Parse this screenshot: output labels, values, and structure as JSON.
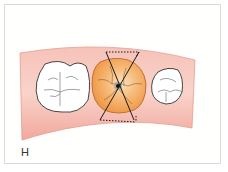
{
  "figure": {
    "panel_label": "H",
    "colors": {
      "gum": "#f4b7ad",
      "gum_edge": "#d9908a",
      "tooth_white": "#ffffff",
      "tooth_outline": "#3a3a3a",
      "target_tooth": "#f2a55a",
      "target_tooth_light": "#fbd6a8",
      "x_lines": "#1a1a1a",
      "frame_border": "#dcdcd6"
    },
    "elements": [
      {
        "name": "left-molar",
        "fill": "white"
      },
      {
        "name": "center-tooth",
        "fill": "orange",
        "marked": "X with dotted hourglass"
      },
      {
        "name": "right-premolar",
        "fill": "white"
      }
    ]
  }
}
